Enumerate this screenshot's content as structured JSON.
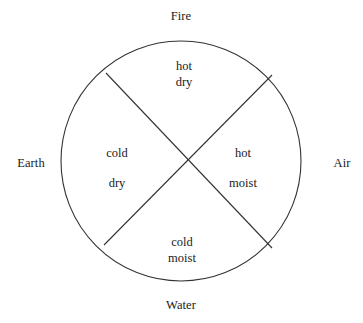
{
  "figure": {
    "type": "four-elements-qualities-wheel",
    "stroke_color": "#333333",
    "background_color": "#ffffff",
    "text_color": "#1a1a1a",
    "circle": {
      "center_x": 181,
      "center_y": 161,
      "radius": 120
    },
    "diagonals": [
      {
        "name": "upper-left-to-lower-right",
        "x1": 106,
        "y1": 73,
        "x2": 272,
        "y2": 248
      },
      {
        "name": "upper-right-to-lower-left",
        "x1": 272,
        "y1": 75,
        "x2": 104,
        "y2": 245
      }
    ],
    "elements": {
      "top": "Fire",
      "right": "Air",
      "bottom": "Water",
      "left": "Earth"
    },
    "qualities": {
      "fire": {
        "first": "hot",
        "second": "dry"
      },
      "air": {
        "first": "hot",
        "second": "moist"
      },
      "earth": {
        "first": "cold",
        "second": "dry"
      },
      "water": {
        "first": "cold",
        "second": "moist"
      }
    }
  }
}
